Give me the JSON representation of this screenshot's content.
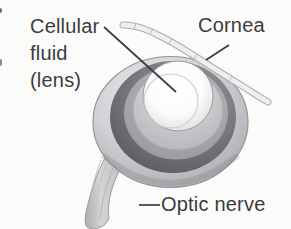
{
  "figure": {
    "background_color": "#fbfbfa",
    "text_color": "#3b3b3f",
    "leader_line_color": "#3c3c40",
    "labels": {
      "cellular_fluid": {
        "lines": [
          "Cellular",
          "fluid",
          "(lens)"
        ]
      },
      "cornea": {
        "text": "Cornea"
      },
      "optic_nerve": {
        "text": "Optic nerve"
      }
    },
    "art_colors": {
      "sclera_light": "#d2d2d6",
      "sclera_edge": "#a2a2a7",
      "pigment_ring_dark": "#636367",
      "middle_ring": "#aaaaae",
      "inner_cup": "#c8c8cc",
      "lens_center": "#ffffff",
      "lens_rim": "#cfcfd2",
      "cornea_membrane_fill": "#eeeeef",
      "cornea_membrane_outline": "#adadb1",
      "optic_nerve_fill": "#c9c9cd",
      "outline": "#94949a"
    }
  }
}
